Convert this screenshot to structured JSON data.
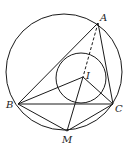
{
  "diagram": {
    "points": {
      "A": {
        "label": "A",
        "x": 98,
        "y": 23
      },
      "B": {
        "label": "B",
        "x": 18,
        "y": 104
      },
      "C": {
        "label": "C",
        "x": 113,
        "y": 104
      },
      "M": {
        "label": "M",
        "x": 67,
        "y": 131
      },
      "I": {
        "label": "I",
        "x": 83,
        "y": 77
      }
    },
    "circles": [
      {
        "name": "circumcircle",
        "cx": 64,
        "cy": 72,
        "r": 58
      },
      {
        "name": "incircle",
        "cx": 81,
        "cy": 78,
        "r": 25
      }
    ],
    "segments": [
      {
        "from": "A",
        "to": "B",
        "style": "solid"
      },
      {
        "from": "A",
        "to": "C",
        "style": "solid"
      },
      {
        "from": "B",
        "to": "C",
        "style": "solid"
      },
      {
        "from": "B",
        "to": "I",
        "style": "solid"
      },
      {
        "from": "C",
        "to": "I",
        "style": "solid"
      },
      {
        "from": "I",
        "to": "M",
        "style": "solid"
      },
      {
        "from": "B",
        "to": "M",
        "style": "solid"
      },
      {
        "from": "C",
        "to": "M",
        "style": "solid"
      },
      {
        "from": "A",
        "to": "I",
        "style": "dashed"
      }
    ],
    "labels": {
      "A": "A",
      "B": "B",
      "C": "C",
      "M": "M",
      "I": "I"
    },
    "stroke_color": "#1a1a1a"
  }
}
